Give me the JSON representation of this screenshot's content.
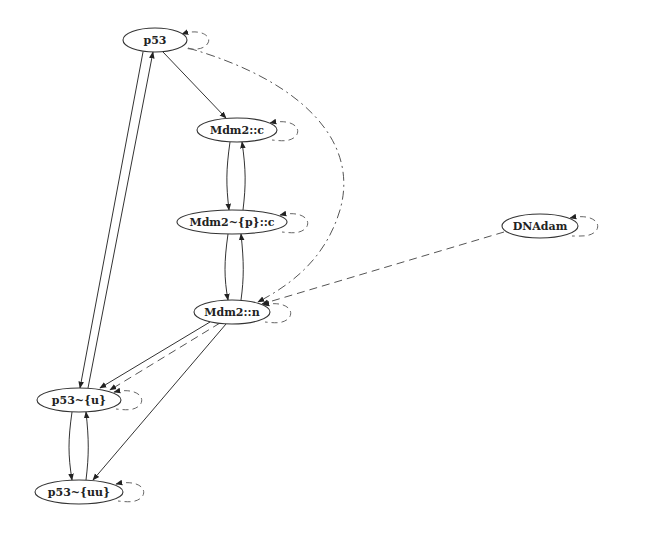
{
  "diagram": {
    "type": "directed-graph",
    "nodes": [
      {
        "id": "p53",
        "label": "p53",
        "cx": 155,
        "cy": 40,
        "rx": 32,
        "ry": 12
      },
      {
        "id": "mdm2_c",
        "label": "Mdm2::c",
        "cx": 237,
        "cy": 130,
        "rx": 40,
        "ry": 12
      },
      {
        "id": "mdm2_p_c",
        "label": "Mdm2~{p}::c",
        "cx": 232,
        "cy": 222,
        "rx": 55,
        "ry": 12
      },
      {
        "id": "dnadam",
        "label": "DNAdam",
        "cx": 540,
        "cy": 226,
        "rx": 38,
        "ry": 12
      },
      {
        "id": "mdm2_n",
        "label": "Mdm2::n",
        "cx": 232,
        "cy": 312,
        "rx": 38,
        "ry": 12
      },
      {
        "id": "p53_u",
        "label": "p53~{u}",
        "cx": 79,
        "cy": 400,
        "rx": 42,
        "ry": 12
      },
      {
        "id": "p53_uu",
        "label": "p53~{uu}",
        "cx": 79,
        "cy": 492,
        "rx": 44,
        "ry": 12
      }
    ],
    "edges": [
      {
        "from": "p53",
        "to": "mdm2_c",
        "style": "solid"
      },
      {
        "from": "mdm2_c",
        "to": "mdm2_p_c",
        "style": "solid"
      },
      {
        "from": "mdm2_p_c",
        "to": "mdm2_c",
        "style": "solid"
      },
      {
        "from": "mdm2_p_c",
        "to": "mdm2_n",
        "style": "solid"
      },
      {
        "from": "mdm2_n",
        "to": "mdm2_p_c",
        "style": "solid"
      },
      {
        "from": "p53",
        "to": "p53_u",
        "style": "solid"
      },
      {
        "from": "p53_u",
        "to": "p53",
        "style": "solid"
      },
      {
        "from": "mdm2_n",
        "to": "p53_u",
        "style": "solid"
      },
      {
        "from": "mdm2_n",
        "to": "p53_u",
        "style": "dashed"
      },
      {
        "from": "mdm2_n",
        "to": "p53_uu",
        "style": "solid"
      },
      {
        "from": "p53_u",
        "to": "p53_uu",
        "style": "solid"
      },
      {
        "from": "p53_uu",
        "to": "p53_u",
        "style": "solid"
      },
      {
        "from": "dnadam",
        "to": "mdm2_n",
        "style": "dashed"
      },
      {
        "from": "p53",
        "to": "mdm2_n",
        "style": "dashdot"
      }
    ],
    "self_loops": [
      "p53",
      "mdm2_c",
      "mdm2_p_c",
      "dnadam",
      "mdm2_n",
      "p53_u",
      "p53_uu"
    ]
  }
}
